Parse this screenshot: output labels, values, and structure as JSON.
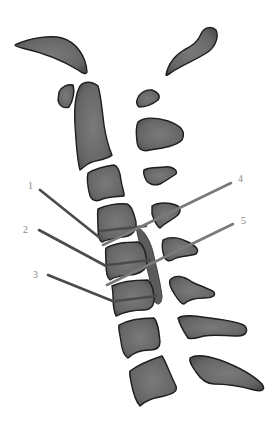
{
  "diagram": {
    "colors": {
      "bone_fill": "#6e6e6e",
      "bone_outline": "#1e1e1e",
      "leader_dark": "#4b4b4b",
      "leader_light": "#7a7a7a",
      "label_text": "#8a8a8a",
      "background": "#ffffff"
    },
    "labels": [
      {
        "id": "1",
        "text": "1",
        "side": "left"
      },
      {
        "id": "2",
        "text": "2",
        "side": "left"
      },
      {
        "id": "3",
        "text": "3",
        "side": "left"
      },
      {
        "id": "4",
        "text": "4",
        "side": "right"
      },
      {
        "id": "5",
        "text": "5",
        "side": "right"
      }
    ]
  }
}
